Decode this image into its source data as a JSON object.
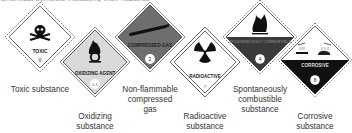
{
  "caption_cropped": "Chemical symbols indicating their hazards",
  "signs": [
    {
      "id": "toxic",
      "text": "TOXIC",
      "class_number": "6",
      "label": [
        "Toxic substance"
      ],
      "fill": "#ffffff",
      "icon": "skull-crossbones-icon"
    },
    {
      "id": "oxidizing",
      "text": "OXIDIZING AGENT",
      "class_number": "5.1",
      "label": [
        "Oxidizing",
        "substance"
      ],
      "fill": "#d9d9d9",
      "icon": "flame-over-circle-icon"
    },
    {
      "id": "compressed-gas",
      "text": "COMPRESSED GAS",
      "class_number": "2",
      "label": [
        "Non-flammable",
        "compressed",
        "gas"
      ],
      "fill": "#6e6e6e",
      "icon": "gas-cylinder-icon"
    },
    {
      "id": "radioactive",
      "text": "RADIOACTIVE",
      "class_number": "7",
      "label": [
        "Radioactive",
        "substance"
      ],
      "fill": "#ffffff",
      "icon": "trefoil-icon"
    },
    {
      "id": "spontaneous",
      "text": "SPONTANEOUSLY COMBUSTIBLE",
      "class_number": "4",
      "label": [
        "Spontaneously",
        "combustible",
        "substance"
      ],
      "fill": "#ffffff",
      "bottom_fill": "#3a3a3a",
      "icon": "flame-icon"
    },
    {
      "id": "corrosive",
      "text": "CORROSIVE",
      "class_number": "8",
      "label": [
        "Corrosive",
        "substance"
      ],
      "fill": "#ffffff",
      "bottom_fill": "#111111",
      "icon": "corrosion-icon"
    }
  ]
}
